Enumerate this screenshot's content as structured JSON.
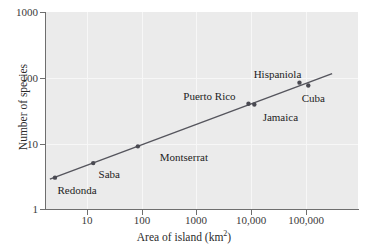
{
  "chart_data": {
    "type": "scatter",
    "title": "",
    "xlabel": "Area of island (km2)",
    "xlabel_base": "Area of island (km",
    "xlabel_sup": "2",
    "xlabel_tail": ")",
    "ylabel": "Number of species",
    "xscale": "log",
    "yscale": "log",
    "xlim": [
      2.1,
      300000
    ],
    "ylim": [
      1,
      1000
    ],
    "grid": true,
    "legend": "none",
    "xticks": [
      10,
      100,
      1000,
      10000,
      100000
    ],
    "xtick_labels": [
      "10",
      "100",
      "1000",
      "10,000",
      "100,000"
    ],
    "yticks": [
      1,
      10,
      100,
      1000
    ],
    "ytick_labels": [
      "1",
      "10",
      "100",
      "1000"
    ],
    "point_color": "#4a4a52",
    "line_color": "#55555d",
    "plot_background": "#ebebeb",
    "gridline_color": "#f7f7f7",
    "points": [
      {
        "name": "Redonda",
        "x": 2.6,
        "y": 3,
        "label_dx": 22,
        "label_dy": 14
      },
      {
        "name": "Saba",
        "x": 13,
        "y": 5,
        "label_dx": 16,
        "label_dy": 13
      },
      {
        "name": "Montserrat",
        "x": 85,
        "y": 9,
        "label_dx": 46,
        "label_dy": 13
      },
      {
        "name": "Puerto Rico",
        "x": 8900,
        "y": 40,
        "label_dx": -39,
        "label_dy": -6
      },
      {
        "name": "Jamaica",
        "x": 11400,
        "y": 39,
        "label_dx": 26,
        "label_dy": 14
      },
      {
        "name": "Hispaniola",
        "x": 76000,
        "y": 84,
        "label_dx": -22,
        "label_dy": -7
      },
      {
        "name": "Cuba",
        "x": 110000,
        "y": 76,
        "label_dx": 5,
        "label_dy": 15
      }
    ],
    "trendline": {
      "description": "fitted power-law regression line",
      "x_start": 2.1,
      "y_start": 2.85,
      "x_end": 300000,
      "y_end": 115
    }
  }
}
